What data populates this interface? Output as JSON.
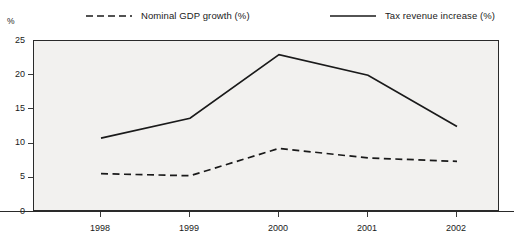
{
  "chart_data": {
    "type": "line",
    "title": "",
    "subtitle": "",
    "xlabel": "",
    "ylabel": "%",
    "unit_label": "%",
    "categories": [
      "1998",
      "1999",
      "2000",
      "2001",
      "2002"
    ],
    "x": [
      1998,
      1999,
      2000,
      2001,
      2002
    ],
    "xlim": [
      1998,
      2002
    ],
    "ylim": [
      0,
      25
    ],
    "yticks": [
      0,
      5,
      10,
      15,
      20,
      25
    ],
    "ytick_labels": [
      "0",
      "5",
      "10",
      "15",
      "20",
      "25"
    ],
    "xtick_labels": [
      "1998",
      "1999",
      "2000",
      "2001",
      "2002"
    ],
    "grid": false,
    "legend_position": "top",
    "plot_background": "#f2f1ef",
    "frame_color": "#2a2a2a",
    "series": [
      {
        "name": "Nominal GDP growth (%)",
        "style": "dashed",
        "color": "#1a1a1a",
        "values": [
          5.6,
          5.3,
          9.3,
          7.9,
          7.4
        ]
      },
      {
        "name": "Tax revenue increase (%)",
        "style": "solid",
        "color": "#1a1a1a",
        "values": [
          10.8,
          13.7,
          23.0,
          20.0,
          12.5
        ]
      }
    ]
  },
  "legend": {
    "items": [
      {
        "label": "Nominal GDP growth (%)",
        "style": "dashed",
        "color": "#1a1a1a"
      },
      {
        "label": "Tax revenue increase (%)",
        "style": "solid",
        "color": "#1a1a1a"
      }
    ]
  },
  "axes": {
    "y_unit": "%",
    "y_labels": [
      "25",
      "20",
      "15",
      "10",
      "5",
      "0"
    ],
    "x_labels": [
      "1998",
      "1999",
      "2000",
      "2001",
      "2002"
    ]
  }
}
